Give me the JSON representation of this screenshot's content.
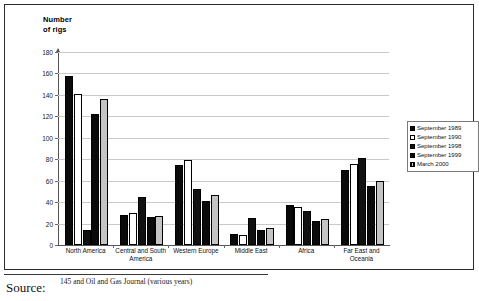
{
  "figure": {
    "axis_title_line1": "Number",
    "axis_title_line2": "of rigs",
    "source_label": "Source:",
    "source_text": "145 and Oil and Gas Journal (various years)"
  },
  "chart_data": {
    "type": "bar",
    "title": "",
    "xlabel": "",
    "ylabel": "Number of rigs",
    "ylim": [
      0,
      180
    ],
    "yticks": [
      0,
      20,
      40,
      60,
      80,
      100,
      120,
      140,
      160,
      180
    ],
    "grid": true,
    "legend_position": "right",
    "categories": [
      "North America",
      "Central and South\nAmerica",
      "Western Europe",
      "Middle East",
      "Africa",
      "Far East and\nOceania"
    ],
    "series": [
      {
        "name": "September 1989",
        "color": "#0a0a0a",
        "values": [
          158,
          28,
          75,
          10,
          37,
          70
        ]
      },
      {
        "name": "September 1990",
        "color": "#ffffff",
        "values": [
          141,
          30,
          79,
          9,
          35,
          76
        ]
      },
      {
        "name": "September 1998",
        "color": "#111111",
        "values": [
          14,
          45,
          52,
          25,
          32,
          81
        ]
      },
      {
        "name": "September 1999",
        "color": "#0a0a0a",
        "values": [
          122,
          26,
          41,
          14,
          22,
          55
        ]
      },
      {
        "name": "March 2000",
        "color": "#c4c4c4",
        "values": [
          136,
          27,
          47,
          16,
          24,
          60
        ]
      }
    ]
  },
  "legend": {
    "items": [
      {
        "label": "September 1989",
        "swatch": "s1989"
      },
      {
        "label": "September 1990",
        "swatch": "s1990"
      },
      {
        "label": "September 1998",
        "swatch": "s1998"
      },
      {
        "label": "September 1999",
        "swatch": "s1999"
      },
      {
        "label": "March 2000",
        "swatch": "m2000"
      }
    ]
  }
}
